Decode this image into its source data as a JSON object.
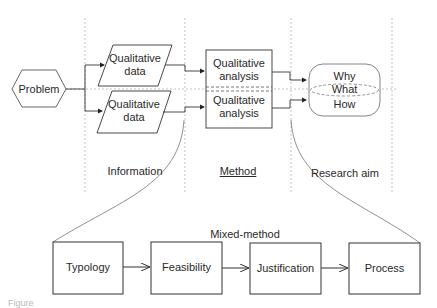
{
  "diagram": {
    "problem": "Problem",
    "data_nodes": [
      {
        "line1": "Qualitative",
        "line2": "data"
      },
      {
        "line1": "Qualitative",
        "line2": "data"
      }
    ],
    "analysis_nodes": [
      {
        "line1": "Qualitative",
        "line2": "analysis"
      },
      {
        "line1": "Qualitative",
        "line2": "analysis"
      }
    ],
    "aims": [
      "Why",
      "What",
      "How"
    ],
    "columns": {
      "information": "Information",
      "method": "Method",
      "research_aim": "Research aim"
    },
    "mixed_method_title": "Mixed-method",
    "mixed_method_steps": [
      "Typology",
      "Feasibility",
      "Justification",
      "Process"
    ]
  },
  "caption": "Figure"
}
